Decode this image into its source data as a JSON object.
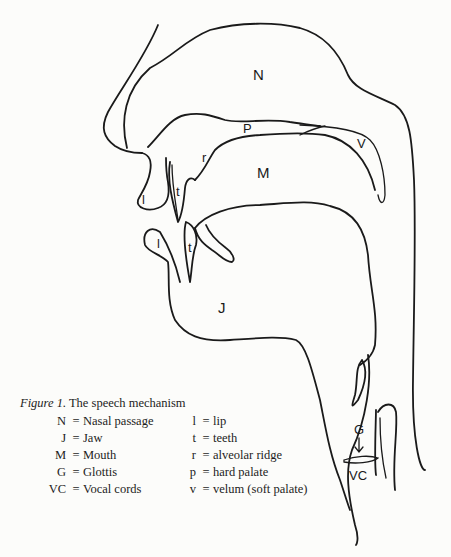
{
  "figure": {
    "caption_number": "Figure 1.",
    "caption_title": "The speech mechanism",
    "diagram_labels": {
      "N": "N",
      "P": "P",
      "V": "V",
      "M": "M",
      "r": "r",
      "t_upper": "t",
      "t_lower": "t",
      "l_upper": "l",
      "l_lower": "l",
      "J": "J",
      "G": "G",
      "VC": "VC"
    },
    "legend_left": [
      {
        "key": "N",
        "eq": "=",
        "value": "Nasal passage"
      },
      {
        "key": "J",
        "eq": "=",
        "value": "Jaw"
      },
      {
        "key": "M",
        "eq": "=",
        "value": "Mouth"
      },
      {
        "key": "G",
        "eq": "=",
        "value": "Glottis"
      },
      {
        "key": "VC",
        "eq": "=",
        "value": "Vocal cords"
      }
    ],
    "legend_right": [
      {
        "key": "l",
        "eq": "=",
        "value": "lip"
      },
      {
        "key": "t",
        "eq": "=",
        "value": "teeth"
      },
      {
        "key": "r",
        "eq": "=",
        "value": "alveolar ridge"
      },
      {
        "key": "p",
        "eq": "=",
        "value": "hard palate"
      },
      {
        "key": "v",
        "eq": "=",
        "value": "velum (soft palate)"
      }
    ]
  }
}
